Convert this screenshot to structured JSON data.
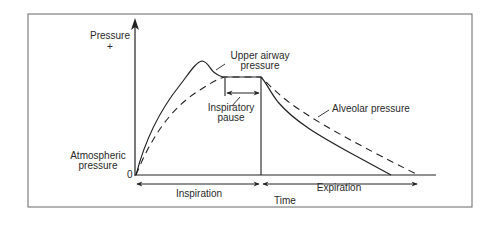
{
  "figure": {
    "y_axis_label": "Pressure",
    "y_axis_sign": "+",
    "origin_label": "0",
    "baseline_label_line1": "Atmospheric",
    "baseline_label_line2": "pressure",
    "x_axis_label": "Time",
    "curves": {
      "upper_airway_line1": "Upper airway",
      "upper_airway_line2": "pressure",
      "alveolar": "Alveolar pressure"
    },
    "pause_label_line1": "Inspiratory",
    "pause_label_line2": "pause",
    "phases": {
      "inspiration": "Inspiration",
      "expiration": "Expiration"
    },
    "colors": {
      "line": "#2a2a2a",
      "frame": "#555555",
      "background": "#ffffff"
    }
  }
}
